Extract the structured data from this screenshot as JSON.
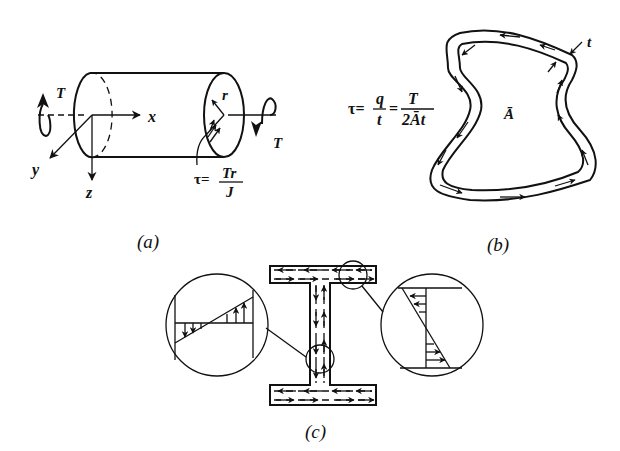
{
  "figure": {
    "panels": [
      {
        "id": "a",
        "caption": "(a)",
        "description": "Solid circular shaft under torque",
        "labels": {
          "torque_left": "T",
          "torque_right": "T",
          "axis_x": "x",
          "axis_y": "y",
          "axis_z": "z",
          "radius": "r"
        },
        "formula": {
          "lhs": "τ=",
          "numerator": "Tr",
          "denominator": "J"
        }
      },
      {
        "id": "b",
        "caption": "(b)",
        "description": "Thin-walled closed section with shear flow",
        "labels": {
          "thickness": "t",
          "enclosed_area": "Ā"
        },
        "formula": {
          "lhs": "τ=",
          "frac1_num": "q",
          "frac1_den": "t",
          "eq": "=",
          "frac2_num": "T",
          "frac2_den": "2Āt"
        }
      },
      {
        "id": "c",
        "caption": "(c)",
        "description": "I-section (open thin-walled) with shear stress distribution, two magnified detail circles"
      }
    ],
    "colors": {
      "ink": "#111111",
      "background": "#ffffff"
    }
  }
}
